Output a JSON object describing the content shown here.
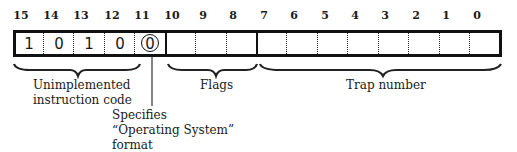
{
  "diagram": {
    "type": "register-bit-field",
    "bit_numbers": [
      "15",
      "14",
      "13",
      "12",
      "11",
      "10",
      "9",
      "8",
      "7",
      "6",
      "5",
      "4",
      "3",
      "2",
      "1",
      "0"
    ],
    "bit_values": {
      "15": "1",
      "14": "0",
      "13": "1",
      "12": "0",
      "11": "0"
    },
    "highlighted_bit": "11",
    "fields": [
      {
        "name": "Unimplemented instruction code",
        "line1": "Unimplemented",
        "line2": "instruction code",
        "bits": "15-12"
      },
      {
        "name": "Flags",
        "line1": "Flags",
        "bits": "10-8"
      },
      {
        "name": "Trap number",
        "line1": "Trap number",
        "bits": "7-0"
      }
    ],
    "callout": {
      "bit": "11",
      "line1": "Specifies",
      "line2": "“Operating System”",
      "line3": "format"
    }
  }
}
